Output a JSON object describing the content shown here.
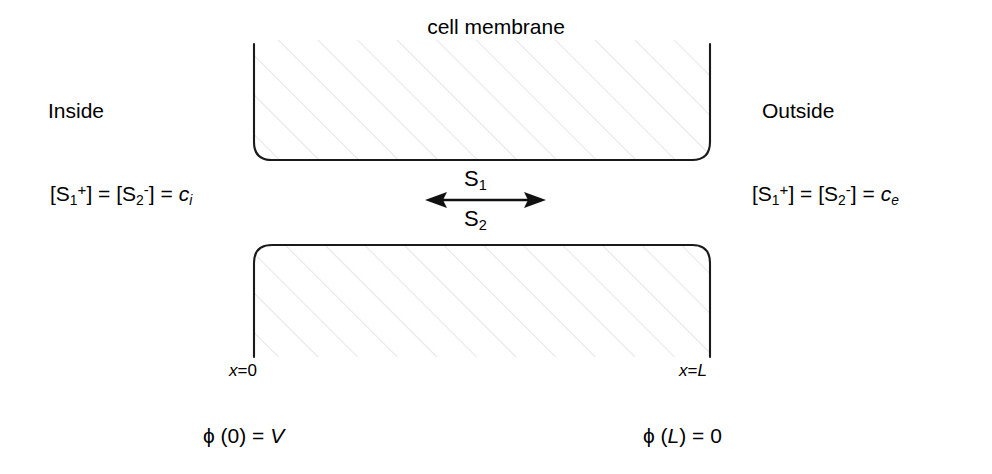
{
  "title": "cell membrane",
  "regions": {
    "inside_label": "Inside",
    "outside_label": "Outside"
  },
  "concentrations": {
    "inside": {
      "species1": "S",
      "species1_sub": "1",
      "species1_charge": "+",
      "species2": "S",
      "species2_sub": "2",
      "species2_charge": "-",
      "value": "c",
      "value_sub": "i",
      "full_text": "[S1+] = [S2-] = ci"
    },
    "outside": {
      "species1": "S",
      "species1_sub": "1",
      "species1_charge": "+",
      "species2": "S",
      "species2_sub": "2",
      "species2_charge": "-",
      "value": "c",
      "value_sub": "e",
      "full_text": "[S1+] = [S2-] = ce"
    }
  },
  "transport": {
    "arrow": "double-headed-horizontal-arrow",
    "species_above": "S",
    "species_above_sub": "1",
    "species_below": "S",
    "species_below_sub": "2"
  },
  "axis": {
    "left": {
      "var": "x",
      "eq": "=0",
      "full_text": "x=0"
    },
    "right": {
      "var": "x",
      "eq": "=",
      "value": "L",
      "full_text": "x=L"
    }
  },
  "potential": {
    "left": {
      "symbol": "ϕ",
      "arg": " (0) = ",
      "value": "V",
      "full_text": "ϕ (0) = V"
    },
    "right": {
      "symbol": "ϕ",
      "arg_open": " (",
      "arg": "L",
      "arg_close": ") = 0",
      "full_text": "ϕ (L) = 0"
    }
  },
  "colors": {
    "stroke": "#1a1a1a",
    "hatch": "#d9d9d9",
    "background": "#ffffff",
    "text": "#000000"
  },
  "geometry": {
    "block_left_x": 254,
    "block_right_x": 710,
    "upper_block_bottom_y": 160,
    "lower_block_top_y": 245,
    "corner_radius": 18,
    "hatch_angle_deg": 45,
    "arrow_y": 200,
    "arrow_x_start": 425,
    "arrow_x_end": 546
  }
}
